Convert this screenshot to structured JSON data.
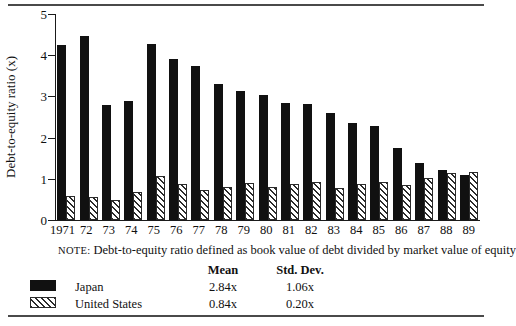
{
  "chart_data": {
    "type": "bar",
    "title": "",
    "subtitle": "",
    "xlabel": "",
    "ylabel": "Debt-to-equity ratio (x)",
    "ylim": [
      0,
      5
    ],
    "yticks": [
      0,
      1,
      2,
      3,
      4,
      5
    ],
    "ytick_labels": [
      "0",
      "1",
      "2",
      "3",
      "4",
      "5"
    ],
    "grid": false,
    "legend_position": "below-plot",
    "categories": [
      "1971",
      "72",
      "73",
      "74",
      "75",
      "76",
      "77",
      "78",
      "79",
      "80",
      "81",
      "82",
      "83",
      "84",
      "85",
      "86",
      "87",
      "88",
      "89"
    ],
    "series": [
      {
        "name": "Japan",
        "fill": "solid-black",
        "color": "#111111",
        "values": [
          4.26,
          4.46,
          2.79,
          2.88,
          4.28,
          3.92,
          3.74,
          3.31,
          3.12,
          3.04,
          2.83,
          2.81,
          2.6,
          2.35,
          2.29,
          1.76,
          1.39,
          1.21,
          1.09
        ]
      },
      {
        "name": "United States",
        "fill": "diagonal-hatch",
        "color": "#2b2b2b",
        "values": [
          0.59,
          0.55,
          0.49,
          0.68,
          1.08,
          0.87,
          0.73,
          0.8,
          0.9,
          0.79,
          0.88,
          0.93,
          0.78,
          0.88,
          0.92,
          0.86,
          1.02,
          1.13,
          1.16
        ]
      }
    ],
    "annotations": []
  },
  "note": {
    "label": "NOTE:",
    "text": "Debt-to-equity ratio defined as book value of debt divided by market value of equity"
  },
  "legend": {
    "headers": {
      "blank": "",
      "mean": "Mean",
      "std_dev": "Std. Dev."
    },
    "rows": [
      {
        "name": "Japan",
        "mean": "2.84x",
        "std_dev": "1.06x",
        "swatch": "solid-black-swatch"
      },
      {
        "name": "United States",
        "mean": "0.84x",
        "std_dev": "0.20x",
        "swatch": "hatched-swatch"
      }
    ]
  }
}
